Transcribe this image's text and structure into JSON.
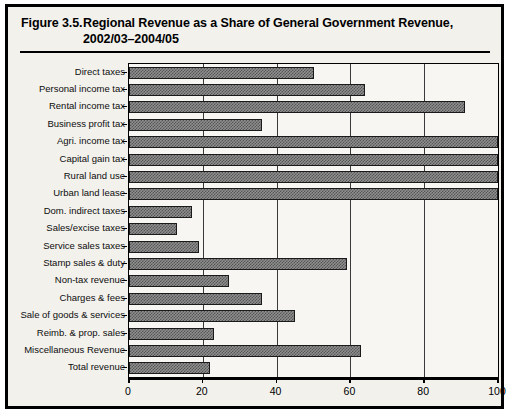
{
  "figure": {
    "number": "Figure 3.5.",
    "title_line1": "Regional Revenue as a Share of General Government Revenue,",
    "title_line2": "2002/03–2004/05"
  },
  "chart_data": {
    "type": "bar",
    "orientation": "horizontal",
    "title": "Regional Revenue as a Share of General Government Revenue, 2002/03–2004/05",
    "xlabel": "",
    "ylabel": "",
    "xlim": [
      0,
      100
    ],
    "xticks": [
      0,
      20,
      40,
      60,
      80,
      100
    ],
    "xtick_labels": [
      "0",
      "20",
      "40",
      "60",
      "80",
      "100"
    ],
    "grid": true,
    "legend": "none",
    "categories": [
      "Direct taxes",
      "Personal income tax",
      "Rental income tax",
      "Business profit tax",
      "Agri. income tax",
      "Capital gain tax",
      "Rural land use",
      "Urban land lease",
      "Dom. indirect taxes",
      "Sales/excise taxes",
      "Service sales taxes",
      "Stamp sales & duty",
      "Non-tax revenue",
      "Charges & fees",
      "Sale of goods & services",
      "Reimb. & prop. sales",
      "Miscellaneous Revenue",
      "Total revenue"
    ],
    "values": [
      50,
      64,
      91,
      36,
      100,
      100,
      100,
      100,
      17,
      13,
      19,
      59,
      27,
      36,
      45,
      23,
      63,
      22
    ]
  }
}
